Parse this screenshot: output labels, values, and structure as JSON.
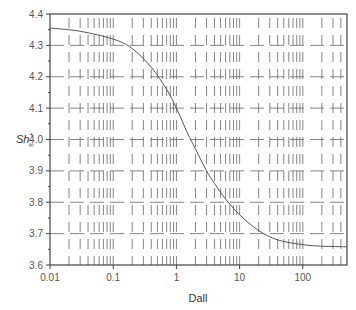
{
  "chart_data": {
    "type": "line",
    "title": "",
    "xlabel": "Dall",
    "ylabel": "Sh*∞",
    "ylabel_main": "Sh",
    "ylabel_sup": "*",
    "ylabel_sub": "∞",
    "xscale": "log",
    "xlim": [
      0.01,
      500
    ],
    "ylim": [
      3.6,
      4.4
    ],
    "grid": true,
    "legend": null,
    "x_ticks": [
      0.01,
      0.1,
      1,
      10,
      100
    ],
    "x_tick_labels": [
      "0.01",
      "0.1",
      "1",
      "10",
      "100"
    ],
    "y_ticks": [
      3.6,
      3.7,
      3.8,
      3.9,
      4.0,
      4.1,
      4.2,
      4.3,
      4.4
    ],
    "y_tick_labels": [
      "3.6",
      "3.7",
      "3.8",
      "3.9",
      "4.0",
      "4.1",
      "4.2",
      "4.3",
      "4.4"
    ],
    "series": [
      {
        "name": "Sh*∞ vs Dall",
        "color": "#555555",
        "x": [
          0.01,
          0.03,
          0.1,
          0.2,
          0.4,
          0.7,
          1.0,
          1.5,
          2.0,
          3.0,
          4.0,
          6.0,
          10,
          20,
          40,
          100,
          200,
          500
        ],
        "y": [
          4.355,
          4.345,
          4.32,
          4.29,
          4.23,
          4.16,
          4.1,
          4.02,
          3.97,
          3.9,
          3.86,
          3.81,
          3.76,
          3.71,
          3.68,
          3.665,
          3.66,
          3.658
        ]
      }
    ]
  }
}
